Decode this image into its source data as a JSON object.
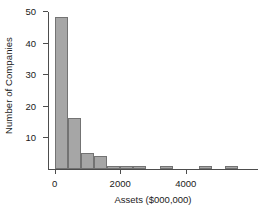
{
  "chart_data": {
    "type": "bar",
    "title": "",
    "xlabel": "Assets ($000,000)",
    "ylabel": "Number of Companies",
    "grid": false,
    "legend": null,
    "xlim": [
      -200,
      6200
    ],
    "ylim": [
      0,
      50
    ],
    "bin_width": 400,
    "bin_starts": [
      0,
      400,
      800,
      1200,
      1600,
      2000,
      2400,
      2800,
      3200,
      3600,
      4000,
      4400,
      4800,
      5200
    ],
    "categories": [
      "0-400",
      "400-800",
      "800-1200",
      "1200-1600",
      "1600-2000",
      "2000-2400",
      "2400-2800",
      "2800-3200",
      "3200-3600",
      "3600-4000",
      "4000-4400",
      "4400-4800",
      "4800-5200",
      "5200-5600"
    ],
    "values": [
      48,
      16,
      5,
      4,
      1,
      1,
      1,
      0,
      1,
      0,
      0,
      1,
      0,
      1
    ],
    "yticks": [
      0,
      10,
      20,
      30,
      40,
      50
    ],
    "ytick_labels": [
      "",
      "10",
      "20",
      "30",
      "40",
      "50"
    ],
    "xticks": [
      0,
      2000,
      4000
    ],
    "xtick_labels": [
      "0",
      "2000",
      "4000"
    ],
    "bar_fill_color": "#a6a6a6",
    "bar_edge_color": "#737373",
    "axis_color": "#4d4d4d",
    "text_color": "#1a1a1a",
    "background_color": "#ffffff"
  }
}
